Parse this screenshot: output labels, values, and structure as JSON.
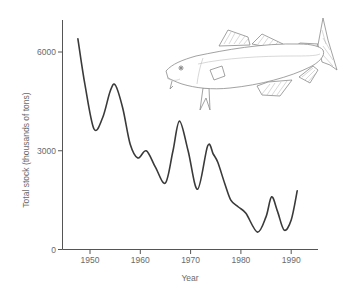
{
  "chart_data": {
    "type": "line",
    "title": "",
    "xlabel": "Year",
    "ylabel": "Total stock (thousands of tons)",
    "xlim": [
      1945.5,
      1995
    ],
    "ylim": [
      0,
      7000
    ],
    "x_ticks": [
      1950,
      1960,
      1970,
      1980,
      1990
    ],
    "x_tick_labels": [
      "1950",
      "1960",
      "1970",
      "1980",
      "1990"
    ],
    "y_ticks": [
      0,
      3000,
      6000
    ],
    "y_tick_labels": [
      "0",
      "3000",
      "6000"
    ],
    "grid": false,
    "legend": null,
    "annotations": [
      "cod fish illustration (upper right)"
    ],
    "series": [
      {
        "name": "Total stock",
        "x": [
          1947.6,
          1949,
          1950.8,
          1952.5,
          1954,
          1955,
          1956.5,
          1958,
          1959.5,
          1961.2,
          1963,
          1965,
          1966.5,
          1967.8,
          1969.5,
          1971.4,
          1973.4,
          1974.5,
          1975.4,
          1976.8,
          1978,
          1979.5,
          1981,
          1983.3,
          1985,
          1986.1,
          1987.3,
          1988.6,
          1990,
          1991.2
        ],
        "values": [
          6400,
          5000,
          3660,
          4000,
          4800,
          5000,
          4300,
          3200,
          2780,
          3000,
          2500,
          2020,
          3000,
          3900,
          3000,
          1830,
          3150,
          2900,
          2650,
          2000,
          1500,
          1290,
          1100,
          530,
          1000,
          1600,
          1150,
          590,
          900,
          1780
        ]
      }
    ]
  },
  "figure": {
    "illustration": "cod-fish"
  }
}
